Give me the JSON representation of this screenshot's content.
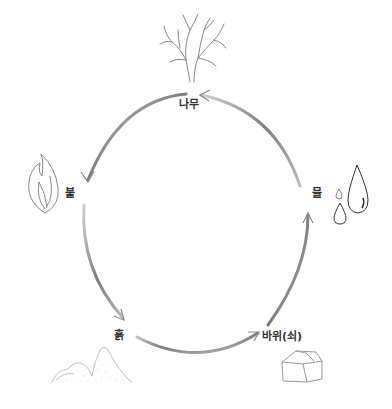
{
  "colors": {
    "arrow": "#8c8c8c",
    "arrow_light": "#bdbdbd",
    "icon_stroke": "#8a8a8a",
    "icon_dark": "#333333",
    "label": "#333333"
  },
  "elements": [
    {
      "id": "wood",
      "label": "나무",
      "icon": "tree-icon"
    },
    {
      "id": "fire",
      "label": "불",
      "icon": "flame-icon"
    },
    {
      "id": "earth",
      "label": "흙",
      "icon": "mountain-icon"
    },
    {
      "id": "metal",
      "label": "바위(쇠)",
      "icon": "rock-icon"
    },
    {
      "id": "water",
      "label": "물",
      "icon": "water-drops-icon"
    }
  ],
  "arrows": [
    {
      "from": "나무",
      "to": "불"
    },
    {
      "from": "불",
      "to": "흙"
    },
    {
      "from": "흙",
      "to": "바위(쇠)"
    },
    {
      "from": "바위(쇠)",
      "to": "물"
    },
    {
      "from": "물",
      "to": "나무"
    }
  ]
}
